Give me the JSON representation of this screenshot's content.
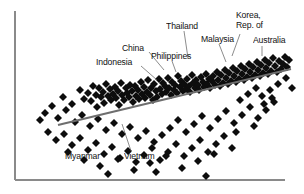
{
  "chart_data": {
    "type": "scatter",
    "title": "",
    "subtitle": "",
    "xlabel": "",
    "ylabel": "",
    "grid": false,
    "legend": "none",
    "xlim": [
      15,
      295
    ],
    "ylim": [
      180,
      8
    ],
    "axes": {
      "left_axis_x": 15,
      "left_axis_y_top": 11,
      "left_axis_y_bottom": 180,
      "bottom_axis_x_left": 15,
      "bottom_axis_x_right": 285,
      "bottom_axis_y": 180,
      "color": "#8a8a8a"
    },
    "trendline": {
      "x1": 58,
      "y1": 125,
      "x2": 291,
      "y2": 69,
      "color": "#6e6e6e",
      "description": "positive-slope fitted regression line"
    },
    "marker": {
      "shape": "diamond",
      "color": "#0d0d0d",
      "size": 5.4
    },
    "points": [
      [
        63,
        97
      ],
      [
        72,
        104
      ],
      [
        80,
        90
      ],
      [
        84,
        99
      ],
      [
        88,
        93
      ],
      [
        91,
        101
      ],
      [
        93,
        86
      ],
      [
        96,
        95
      ],
      [
        97,
        107
      ],
      [
        99,
        88
      ],
      [
        101,
        97
      ],
      [
        103,
        92
      ],
      [
        104,
        103
      ],
      [
        106,
        84
      ],
      [
        108,
        96
      ],
      [
        110,
        89
      ],
      [
        111,
        100
      ],
      [
        113,
        94
      ],
      [
        115,
        87
      ],
      [
        116,
        98
      ],
      [
        118,
        91
      ],
      [
        119,
        105
      ],
      [
        121,
        83
      ],
      [
        122,
        95
      ],
      [
        124,
        100
      ],
      [
        126,
        88
      ],
      [
        127,
        93
      ],
      [
        129,
        97
      ],
      [
        130,
        85
      ],
      [
        132,
        91
      ],
      [
        133,
        102
      ],
      [
        135,
        86
      ],
      [
        136,
        96
      ],
      [
        138,
        90
      ],
      [
        139,
        99
      ],
      [
        141,
        82
      ],
      [
        142,
        94
      ],
      [
        144,
        87
      ],
      [
        145,
        98
      ],
      [
        147,
        92
      ],
      [
        148,
        80
      ],
      [
        150,
        95
      ],
      [
        151,
        88
      ],
      [
        153,
        100
      ],
      [
        154,
        84
      ],
      [
        156,
        91
      ],
      [
        157,
        97
      ],
      [
        159,
        79
      ],
      [
        160,
        89
      ],
      [
        162,
        94
      ],
      [
        163,
        83
      ],
      [
        165,
        86
      ],
      [
        166,
        92
      ],
      [
        168,
        78
      ],
      [
        169,
        88
      ],
      [
        171,
        95
      ],
      [
        172,
        82
      ],
      [
        174,
        90
      ],
      [
        175,
        85
      ],
      [
        177,
        93
      ],
      [
        178,
        76
      ],
      [
        180,
        87
      ],
      [
        181,
        81
      ],
      [
        183,
        91
      ],
      [
        184,
        84
      ],
      [
        186,
        89
      ],
      [
        187,
        79
      ],
      [
        189,
        86
      ],
      [
        190,
        92
      ],
      [
        192,
        75
      ],
      [
        193,
        83
      ],
      [
        195,
        88
      ],
      [
        196,
        80
      ],
      [
        198,
        85
      ],
      [
        199,
        90
      ],
      [
        201,
        77
      ],
      [
        203,
        82
      ],
      [
        204,
        87
      ],
      [
        206,
        74
      ],
      [
        207,
        84
      ],
      [
        209,
        79
      ],
      [
        210,
        88
      ],
      [
        212,
        81
      ],
      [
        213,
        76
      ],
      [
        215,
        85
      ],
      [
        217,
        72
      ],
      [
        218,
        80
      ],
      [
        220,
        86
      ],
      [
        221,
        75
      ],
      [
        223,
        83
      ],
      [
        225,
        70
      ],
      [
        226,
        78
      ],
      [
        228,
        84
      ],
      [
        229,
        73
      ],
      [
        231,
        81
      ],
      [
        233,
        68
      ],
      [
        234,
        76
      ],
      [
        236,
        82
      ],
      [
        237,
        71
      ],
      [
        239,
        79
      ],
      [
        241,
        66
      ],
      [
        242,
        74
      ],
      [
        244,
        80
      ],
      [
        245,
        69
      ],
      [
        247,
        77
      ],
      [
        249,
        64
      ],
      [
        250,
        72
      ],
      [
        252,
        78
      ],
      [
        253,
        67
      ],
      [
        255,
        75
      ],
      [
        257,
        62
      ],
      [
        258,
        70
      ],
      [
        260,
        76
      ],
      [
        261,
        65
      ],
      [
        263,
        73
      ],
      [
        265,
        60
      ],
      [
        266,
        68
      ],
      [
        268,
        74
      ],
      [
        269,
        63
      ],
      [
        271,
        71
      ],
      [
        273,
        58
      ],
      [
        275,
        66
      ],
      [
        277,
        72
      ],
      [
        279,
        61
      ],
      [
        281,
        69
      ],
      [
        283,
        64
      ],
      [
        285,
        57
      ],
      [
        287,
        67
      ],
      [
        289,
        60
      ],
      [
        45,
        113
      ],
      [
        52,
        106
      ],
      [
        58,
        118
      ],
      [
        66,
        110
      ],
      [
        75,
        122
      ],
      [
        82,
        115
      ],
      [
        90,
        126
      ],
      [
        98,
        119
      ],
      [
        106,
        130
      ],
      [
        114,
        123
      ],
      [
        122,
        134
      ],
      [
        130,
        127
      ],
      [
        138,
        138
      ],
      [
        146,
        131
      ],
      [
        154,
        142
      ],
      [
        162,
        135
      ],
      [
        170,
        128
      ],
      [
        178,
        120
      ],
      [
        186,
        132
      ],
      [
        194,
        124
      ],
      [
        202,
        116
      ],
      [
        210,
        128
      ],
      [
        218,
        119
      ],
      [
        226,
        111
      ],
      [
        234,
        123
      ],
      [
        242,
        115
      ],
      [
        250,
        107
      ],
      [
        258,
        118
      ],
      [
        266,
        110
      ],
      [
        274,
        102
      ],
      [
        40,
        120
      ],
      [
        48,
        132
      ],
      [
        56,
        140
      ],
      [
        64,
        134
      ],
      [
        72,
        145
      ],
      [
        80,
        138
      ],
      [
        88,
        150
      ],
      [
        96,
        143
      ],
      [
        104,
        154
      ],
      [
        112,
        147
      ],
      [
        120,
        158
      ],
      [
        128,
        151
      ],
      [
        136,
        162
      ],
      [
        144,
        155
      ],
      [
        152,
        148
      ],
      [
        160,
        160
      ],
      [
        168,
        152
      ],
      [
        176,
        144
      ],
      [
        184,
        156
      ],
      [
        192,
        148
      ],
      [
        200,
        140
      ],
      [
        208,
        152
      ],
      [
        216,
        144
      ],
      [
        224,
        136
      ],
      [
        232,
        148
      ],
      [
        68,
        152
      ],
      [
        84,
        160
      ],
      [
        100,
        166
      ],
      [
        118,
        159
      ],
      [
        134,
        170
      ],
      [
        150,
        163
      ],
      [
        166,
        156
      ],
      [
        182,
        168
      ],
      [
        198,
        161
      ],
      [
        214,
        154
      ],
      [
        108,
        174
      ],
      [
        156,
        172
      ],
      [
        206,
        176
      ],
      [
        236,
        132
      ],
      [
        254,
        126
      ],
      [
        262,
        96
      ],
      [
        270,
        90
      ],
      [
        278,
        84
      ],
      [
        286,
        78
      ],
      [
        292,
        88
      ],
      [
        240,
        100
      ],
      [
        248,
        94
      ],
      [
        256,
        88
      ],
      [
        264,
        104
      ],
      [
        272,
        98
      ]
    ],
    "labels": [
      {
        "id": "indonesia",
        "text": "Indonesia",
        "x": 96,
        "y": 58,
        "align": "left",
        "leader": {
          "x1": 141,
          "y1": 66,
          "x2": 157,
          "y2": 80
        }
      },
      {
        "id": "china",
        "text": "China",
        "x": 122,
        "y": 44,
        "align": "left",
        "leader": {
          "x1": 149,
          "y1": 52,
          "x2": 164,
          "y2": 70
        }
      },
      {
        "id": "philippines",
        "text": "Philippines",
        "x": 151,
        "y": 52,
        "align": "left",
        "leader": {
          "x1": 172,
          "y1": 61,
          "x2": 176,
          "y2": 72
        }
      },
      {
        "id": "thailand",
        "text": "Thailand",
        "x": 166,
        "y": 22,
        "align": "left",
        "leader": {
          "x1": 184,
          "y1": 31,
          "x2": 188,
          "y2": 58
        }
      },
      {
        "id": "malaysia",
        "text": "Malaysia",
        "x": 201,
        "y": 35,
        "align": "left",
        "leader": {
          "x1": 219,
          "y1": 44,
          "x2": 226,
          "y2": 62
        }
      },
      {
        "id": "korea",
        "text": "Korea,\nRep. of",
        "x": 236,
        "y": 11,
        "align": "left",
        "leader": {
          "x1": 240,
          "y1": 34,
          "x2": 232,
          "y2": 56
        }
      },
      {
        "id": "australia",
        "text": "Australia",
        "x": 253,
        "y": 36,
        "align": "left",
        "leader": {
          "x1": 262,
          "y1": 46,
          "x2": 262,
          "y2": 56
        }
      },
      {
        "id": "myanmar",
        "text": "Myanmar",
        "x": 65,
        "y": 152,
        "align": "left",
        "leader": null
      },
      {
        "id": "vietnam",
        "text": "Vietnam",
        "x": 124,
        "y": 152,
        "align": "left",
        "leader": {
          "x1": 131,
          "y1": 151,
          "x2": 122,
          "y2": 124
        }
      }
    ]
  }
}
